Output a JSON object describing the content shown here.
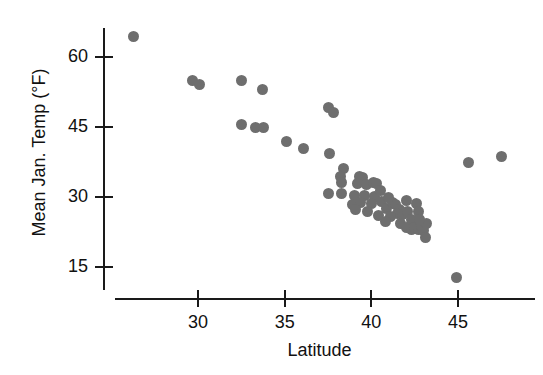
{
  "chart_data": {
    "type": "scatter",
    "title": "",
    "xlabel": "Latitude",
    "ylabel": "Mean Jan. Temp (°F)",
    "xlim": [
      25.3,
      49.2
    ],
    "ylim": [
      9.5,
      68.0
    ],
    "xticks": [
      30,
      35,
      40,
      45
    ],
    "xtick_labels": [
      "30",
      "35",
      "40",
      "45"
    ],
    "yticks": [
      15,
      30,
      45,
      60
    ],
    "ytick_labels": [
      "15",
      "30",
      "45",
      "60"
    ],
    "grid": false,
    "legend": null,
    "marker_color": "#6e6e6e",
    "axis_color": "#1a1a1a",
    "background_color": "#ffffff",
    "n_points": 62,
    "points": [
      {
        "x": 26.3,
        "y": 64.5
      },
      {
        "x": 29.7,
        "y": 55.0
      },
      {
        "x": 30.1,
        "y": 54.2
      },
      {
        "x": 32.5,
        "y": 55.0
      },
      {
        "x": 33.7,
        "y": 53.0
      },
      {
        "x": 32.5,
        "y": 45.5
      },
      {
        "x": 33.3,
        "y": 44.8
      },
      {
        "x": 33.8,
        "y": 44.8
      },
      {
        "x": 35.1,
        "y": 42.0
      },
      {
        "x": 36.1,
        "y": 40.5
      },
      {
        "x": 37.5,
        "y": 49.2
      },
      {
        "x": 37.8,
        "y": 48.2
      },
      {
        "x": 37.6,
        "y": 39.3
      },
      {
        "x": 38.4,
        "y": 36.2
      },
      {
        "x": 38.2,
        "y": 34.3
      },
      {
        "x": 38.3,
        "y": 33.2
      },
      {
        "x": 37.5,
        "y": 30.8
      },
      {
        "x": 38.3,
        "y": 30.8
      },
      {
        "x": 39.3,
        "y": 34.5
      },
      {
        "x": 39.5,
        "y": 34.2
      },
      {
        "x": 39.2,
        "y": 32.8
      },
      {
        "x": 39.7,
        "y": 32.6
      },
      {
        "x": 40.1,
        "y": 33.2
      },
      {
        "x": 40.3,
        "y": 32.8
      },
      {
        "x": 39.0,
        "y": 30.3
      },
      {
        "x": 39.6,
        "y": 30.4
      },
      {
        "x": 40.2,
        "y": 30.2
      },
      {
        "x": 38.9,
        "y": 28.4
      },
      {
        "x": 39.4,
        "y": 28.8
      },
      {
        "x": 40.0,
        "y": 28.6
      },
      {
        "x": 40.6,
        "y": 29.0
      },
      {
        "x": 39.1,
        "y": 27.4
      },
      {
        "x": 39.8,
        "y": 26.9
      },
      {
        "x": 40.4,
        "y": 26.1
      },
      {
        "x": 40.9,
        "y": 27.6
      },
      {
        "x": 41.2,
        "y": 28.9
      },
      {
        "x": 41.4,
        "y": 28.3
      },
      {
        "x": 41.6,
        "y": 27.3
      },
      {
        "x": 41.5,
        "y": 26.4
      },
      {
        "x": 41.8,
        "y": 26.2
      },
      {
        "x": 41.1,
        "y": 25.8
      },
      {
        "x": 42.0,
        "y": 29.2
      },
      {
        "x": 42.1,
        "y": 26.9
      },
      {
        "x": 42.3,
        "y": 25.2
      },
      {
        "x": 41.7,
        "y": 24.3
      },
      {
        "x": 42.0,
        "y": 23.5
      },
      {
        "x": 42.3,
        "y": 23.1
      },
      {
        "x": 42.5,
        "y": 23.4
      },
      {
        "x": 42.7,
        "y": 23.0
      },
      {
        "x": 42.9,
        "y": 23.6
      },
      {
        "x": 43.0,
        "y": 22.8
      },
      {
        "x": 43.2,
        "y": 24.4
      },
      {
        "x": 43.1,
        "y": 21.4
      },
      {
        "x": 40.8,
        "y": 24.8
      },
      {
        "x": 41.0,
        "y": 29.8
      },
      {
        "x": 42.6,
        "y": 28.6
      },
      {
        "x": 42.7,
        "y": 26.8
      },
      {
        "x": 42.8,
        "y": 25.1
      },
      {
        "x": 44.9,
        "y": 12.8
      },
      {
        "x": 45.6,
        "y": 37.5
      },
      {
        "x": 47.5,
        "y": 38.7
      },
      {
        "x": 40.5,
        "y": 31.4
      }
    ]
  }
}
